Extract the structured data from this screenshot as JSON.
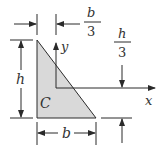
{
  "figure": {
    "shape": "right-triangle",
    "fill_color": "#d9d9d9",
    "line_color": "#2a2a2a",
    "labels": {
      "centroid": "C",
      "x_axis": "x",
      "y_axis": "y",
      "height": "h",
      "base": "b",
      "offset_x_num": "b",
      "offset_x_den": "3",
      "offset_y_num": "h",
      "offset_y_den": "3"
    }
  }
}
